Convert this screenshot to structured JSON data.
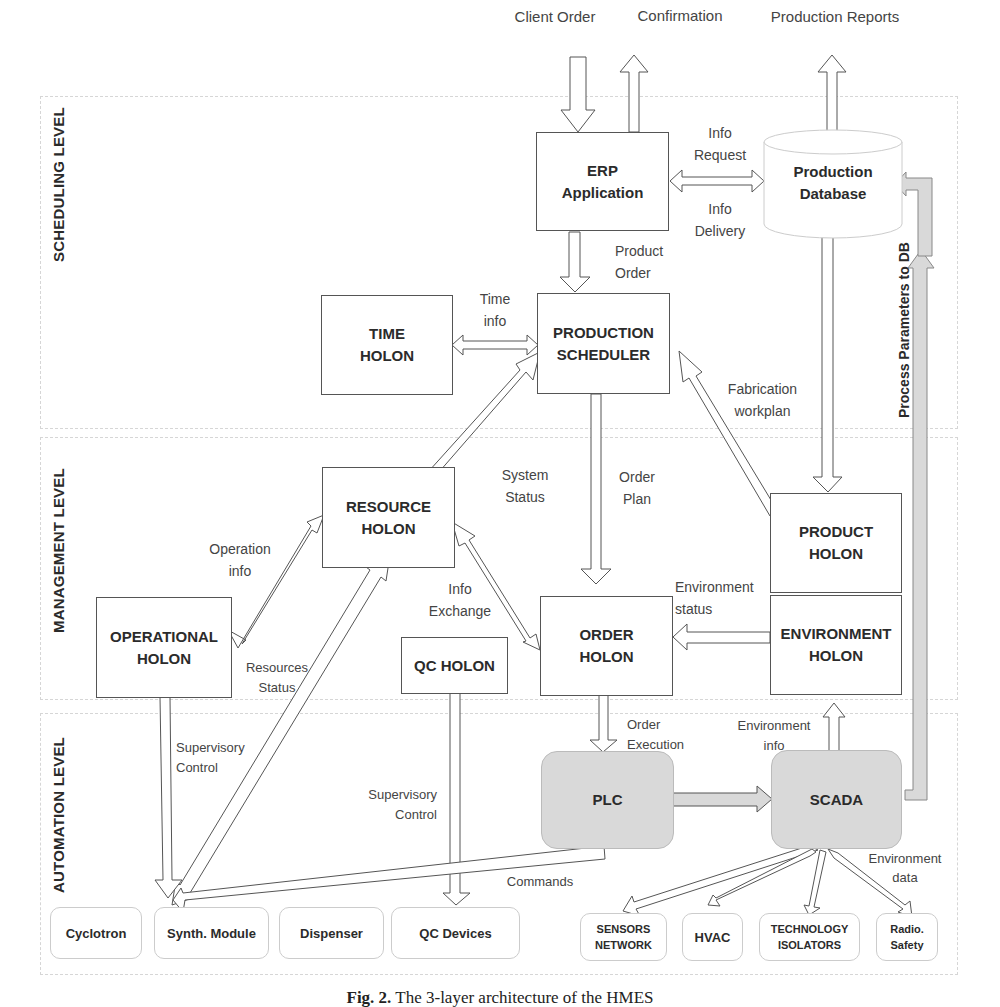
{
  "levels": [
    {
      "id": "scheduling",
      "label": "SCHEDULING LEVEL"
    },
    {
      "id": "management",
      "label": "MANAGEMENT LEVEL"
    },
    {
      "id": "automation",
      "label": "AUTOMATION LEVEL"
    }
  ],
  "external_io": {
    "client_order": "Client Order",
    "confirmation": "Confirmation",
    "production_reports": "Production Reports"
  },
  "nodes": {
    "erp": "ERP\nApplication",
    "production_database": "Production\nDatabase",
    "time_holon": "TIME\nHOLON",
    "production_scheduler": "PRODUCTION\nSCHEDULER",
    "resource_holon": "RESOURCE\nHOLON",
    "product_holon": "PRODUCT\nHOLON",
    "operational_holon": "OPERATIONAL\nHOLON",
    "qc_holon": "QC HOLON",
    "order_holon": "ORDER\nHOLON",
    "environment_holon": "ENVIRONMENT\nHOLON",
    "plc": "PLC",
    "scada": "SCADA"
  },
  "devices": [
    {
      "id": "cyclotron",
      "label": "Cyclotron"
    },
    {
      "id": "synth-module",
      "label": "Synth. Module"
    },
    {
      "id": "dispenser",
      "label": "Dispenser"
    },
    {
      "id": "qc-devices",
      "label": "QC Devices"
    },
    {
      "id": "sensors-network",
      "label": "SENSORS\nNETWORK"
    },
    {
      "id": "hvac",
      "label": "HVAC"
    },
    {
      "id": "technology-isolators",
      "label": "TECHNOLOGY\nISOLATORS"
    },
    {
      "id": "radio-safety",
      "label": "Radio.\nSafety"
    }
  ],
  "edge_labels": {
    "info_request": "Info\nRequest",
    "info_delivery": "Info\nDelivery",
    "product_order": "Product\nOrder",
    "time_info": "Time\ninfo",
    "fabrication_workplan": "Fabrication\nworkplan",
    "process_parameters": "Process Parameters to DB",
    "system_status": "System\nStatus",
    "order_plan": "Order\nPlan",
    "operation_info": "Operation\ninfo",
    "info_exchange": "Info\nExchange",
    "resources_status": "Resources\nStatus",
    "environment_status": "Environment\nstatus",
    "order_execution": "Order\nExecution",
    "environment_info": "Environment\ninfo",
    "supervisory_control_1": "Supervisory\nControl",
    "supervisory_control_2": "Supervisory\nControl",
    "commands": "Commands",
    "environment_data": "Environment\ndata"
  },
  "caption": {
    "prefix": "Fig. 2.",
    "text": " The 3-layer architecture of the HMES"
  },
  "colors": {
    "box_border": "#555555",
    "grey_fill": "#d9d9d9",
    "band_border": "#d6d6d6",
    "text": "#2b2b2b"
  }
}
